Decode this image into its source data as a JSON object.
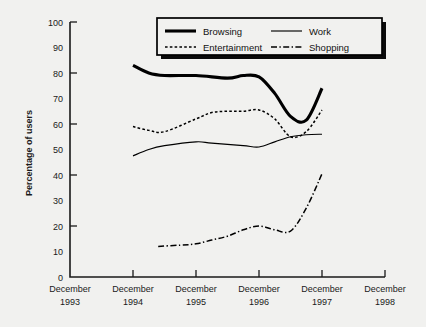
{
  "chart_data": {
    "type": "line",
    "title": "",
    "xlabel": "",
    "ylabel": "Percentage of users",
    "ylim": [
      0,
      100
    ],
    "ytick_step": 10,
    "yticks": [
      0,
      10,
      20,
      30,
      40,
      50,
      60,
      70,
      80,
      90,
      100
    ],
    "ytick_labels": [
      "0",
      "10",
      "20",
      "30",
      "40",
      "50",
      "60",
      "70",
      "80",
      "90",
      "100"
    ],
    "major_yticks": [
      0,
      20,
      40,
      60,
      80,
      100
    ],
    "xticks": [
      "December 1993",
      "December 1994",
      "December 1995",
      "December 1996",
      "December 1997",
      "December 1998"
    ],
    "xtick_labels": [
      {
        "month": "December",
        "year": "1993"
      },
      {
        "month": "December",
        "year": "1994"
      },
      {
        "month": "December",
        "year": "1995"
      },
      {
        "month": "December",
        "year": "1996"
      },
      {
        "month": "December",
        "year": "1997"
      },
      {
        "month": "December",
        "year": "1998"
      }
    ],
    "grid": false,
    "legend_position": "top-center",
    "x_range_years": [
      1993.0,
      1998.0
    ],
    "series": [
      {
        "name": "Browsing",
        "style": "thick-solid",
        "color": "#000000",
        "x": [
          1994.0,
          1994.25,
          1994.5,
          1995.0,
          1995.5,
          1995.75,
          1996.0,
          1996.25,
          1996.5,
          1996.75,
          1997.0
        ],
        "values": [
          83,
          80,
          79,
          79,
          78,
          79,
          78.5,
          72,
          63,
          61.5,
          74
        ]
      },
      {
        "name": "Work",
        "style": "thin-solid",
        "color": "#000000",
        "x": [
          1994.0,
          1994.25,
          1994.5,
          1995.0,
          1995.25,
          1995.75,
          1996.0,
          1996.25,
          1996.5,
          1996.75,
          1997.0
        ],
        "values": [
          47.5,
          50,
          51.5,
          53,
          52.5,
          51.5,
          51,
          53,
          55,
          55.8,
          56
        ]
      },
      {
        "name": "Entertainment",
        "style": "dotted",
        "color": "#000000",
        "x": [
          1994.0,
          1994.25,
          1994.5,
          1995.0,
          1995.25,
          1995.5,
          1995.75,
          1996.0,
          1996.25,
          1996.5,
          1996.75,
          1997.0
        ],
        "values": [
          59,
          57.5,
          57,
          62,
          64.5,
          65,
          65,
          65.5,
          62,
          55,
          57,
          65.5
        ]
      },
      {
        "name": "Shopping",
        "style": "dash-dot",
        "color": "#000000",
        "x": [
          1994.4,
          1994.75,
          1995.0,
          1995.25,
          1995.5,
          1995.75,
          1996.0,
          1996.25,
          1996.5,
          1996.75,
          1997.0
        ],
        "values": [
          12,
          12.5,
          13,
          14.5,
          16,
          18.5,
          20,
          18.5,
          18,
          27,
          40.5
        ]
      }
    ]
  },
  "legend": {
    "items": [
      {
        "label": "Browsing",
        "style": "thick-solid"
      },
      {
        "label": "Work",
        "style": "thin-solid"
      },
      {
        "label": "Entertainment",
        "style": "dotted"
      },
      {
        "label": "Shopping",
        "style": "dash-dot"
      }
    ]
  },
  "colors": {
    "background": "#f1f1ef",
    "axis": "#1a1a1a",
    "series": "#000000"
  }
}
